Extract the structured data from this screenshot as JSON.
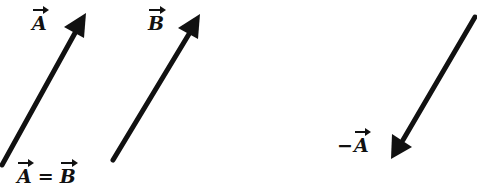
{
  "diagram": {
    "arrow_color": "#111111",
    "vectors": [
      {
        "name": "A",
        "label": "A",
        "tail": [
          2,
          165
        ],
        "head": [
          86,
          14
        ]
      },
      {
        "name": "B",
        "label": "B",
        "tail": [
          113,
          160
        ],
        "head": [
          200,
          15
        ]
      },
      {
        "name": "-A",
        "label": "A",
        "prefix": "−",
        "tail": [
          476,
          16
        ],
        "head": [
          392,
          158
        ]
      }
    ],
    "labels": {
      "a": "A",
      "b": "B",
      "eq_left": "A",
      "eq_sign": "=",
      "eq_right": "B",
      "neg_sign": "−",
      "neg_vec": "A"
    }
  }
}
